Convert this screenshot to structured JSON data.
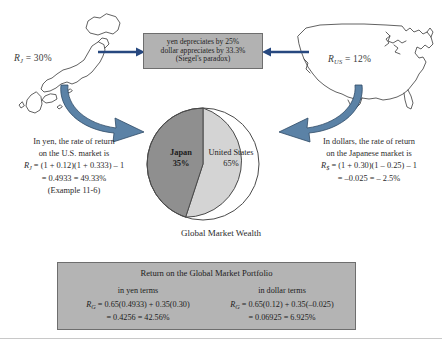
{
  "figure": {
    "caption_pie": "Global Market Wealth"
  },
  "japan_return": {
    "symbol": "R",
    "subscript": "J",
    "equals": " = ",
    "value": "30%"
  },
  "us_return": {
    "symbol": "R",
    "subscript": "US",
    "equals": " = ",
    "value": "12%"
  },
  "paradox_box": {
    "line1": "yen depreciates by 25%",
    "line2": "dollar appreciates by 33.3%",
    "line3": "(Siegel's paradox)"
  },
  "pie": {
    "japan_name": "Japan",
    "japan_pct": "35%",
    "us_name": "United States",
    "us_pct": "65%"
  },
  "left_block": {
    "line1": "In yen, the rate of return",
    "line2": "on the U.S. market is",
    "formula_symbol": "R",
    "formula_sub": "J",
    "formula_body": " = (1 + 0.12)(1 + 0.333) – 1",
    "result": "= 0.4933 = 49.33%",
    "note": "(Example 11-6)"
  },
  "right_block": {
    "line1": "In dollars, the rate of return",
    "line2": "on the Japanese market is",
    "formula_symbol": "R",
    "formula_sub": "$",
    "formula_body": " = (1 + 0.30)(1 – 0.25) – 1",
    "result": "= –0.025 = – 2.5%"
  },
  "portfolio_box": {
    "title": "Return on the Global Market Portfolio",
    "yen": {
      "header": "in yen terms",
      "symbol": "R",
      "sub": "G",
      "body": " = 0.65(0.4933) + 0.35(0.30)",
      "result": "= 0.4256 = 42.56%"
    },
    "dollar": {
      "header": "in dollar terms",
      "symbol": "R",
      "sub": "G",
      "body": " = 0.65(0.12) + 0.35(–0.025)",
      "result": "= 0.06925 = 6.925%"
    }
  },
  "colors": {
    "arrow_blue": "#5b82a6",
    "arrow_navy": "#27487f",
    "box_grey": "#b2b2b2",
    "pie_japan": "#8f8f8f",
    "pie_us": "#d4d4d4",
    "outline": "#3a3a3a"
  }
}
